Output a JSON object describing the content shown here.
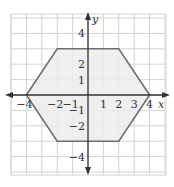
{
  "chart_data": {
    "type": "diagram",
    "title": "",
    "shape": "hexagon",
    "vertices": [
      [
        -4,
        0
      ],
      [
        -2,
        3
      ],
      [
        2,
        3
      ],
      [
        4,
        0
      ],
      [
        2,
        -3
      ],
      [
        -2,
        -3
      ]
    ],
    "fill_color": "#ececec",
    "stroke_color": "#6e6e6e",
    "grid": true,
    "grid_color": "#d4d4d4",
    "xlabel": "x",
    "ylabel": "y",
    "xlim": [
      -5,
      5
    ],
    "ylim": [
      -5.2,
      5.2
    ],
    "x_ticks": [
      {
        "value": -4,
        "label": "−4"
      },
      {
        "value": -2,
        "label": "−2"
      },
      {
        "value": -1,
        "label": "−1"
      },
      {
        "value": 1,
        "label": "1"
      },
      {
        "value": 2,
        "label": "2"
      },
      {
        "value": 3,
        "label": "3"
      },
      {
        "value": 4,
        "label": "4"
      }
    ],
    "y_ticks": [
      {
        "value": 4,
        "label": "4"
      },
      {
        "value": 2,
        "label": "2"
      },
      {
        "value": 1,
        "label": "1"
      },
      {
        "value": -1,
        "label": "−1"
      },
      {
        "value": -2,
        "label": "−2"
      },
      {
        "value": -4,
        "label": "−4"
      }
    ]
  },
  "labels": {
    "x_axis": "x",
    "y_axis": "y"
  }
}
